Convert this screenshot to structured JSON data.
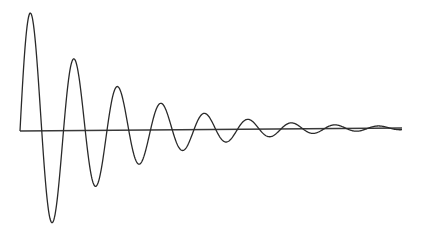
{
  "figure": {
    "title": "Damped oscillation",
    "background": "#ffffff",
    "stroke_color": "#2a2a2a",
    "axis_color": "#3a3a3a"
  },
  "chart_data": {
    "type": "line",
    "title": "",
    "xlabel": "",
    "ylabel": "",
    "baseline": {
      "x_start_px": 20,
      "y_start_px": 131,
      "x_end_px": 402,
      "y_end_px": 128
    },
    "period_px": 43.5,
    "amplitude_px": 133,
    "decay_per_px": 0.0114,
    "extrema": [
      {
        "kind": "peak",
        "x": 29.5,
        "y": 12
      },
      {
        "kind": "trough",
        "x": 52,
        "y": 222
      },
      {
        "kind": "peak",
        "x": 73,
        "y": 58
      },
      {
        "kind": "trough",
        "x": 95,
        "y": 185
      },
      {
        "kind": "peak",
        "x": 116,
        "y": 86
      },
      {
        "kind": "trough",
        "x": 138,
        "y": 163
      },
      {
        "kind": "peak",
        "x": 159,
        "y": 103
      },
      {
        "kind": "trough",
        "x": 181,
        "y": 149
      },
      {
        "kind": "peak",
        "x": 202,
        "y": 113
      },
      {
        "kind": "trough",
        "x": 225,
        "y": 141
      },
      {
        "kind": "peak",
        "x": 246,
        "y": 120
      },
      {
        "kind": "trough",
        "x": 267,
        "y": 135
      },
      {
        "kind": "peak",
        "x": 289,
        "y": 123
      },
      {
        "kind": "trough",
        "x": 310,
        "y": 132
      },
      {
        "kind": "peak",
        "x": 332,
        "y": 124
      },
      {
        "kind": "trough",
        "x": 354,
        "y": 130
      },
      {
        "kind": "peak",
        "x": 375,
        "y": 125
      }
    ]
  }
}
